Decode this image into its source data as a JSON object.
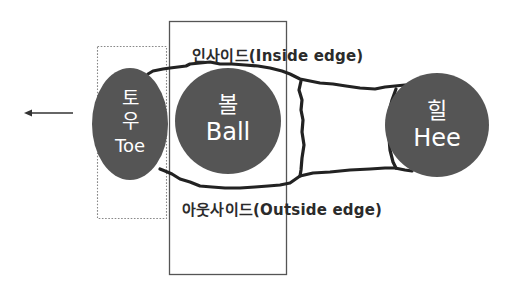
{
  "diagram": {
    "type": "foot-zones",
    "colors": {
      "zone_fill": "#555555",
      "zone_text": "#ffffff",
      "outline": "#222222",
      "box_stroke": "#555555",
      "dotted_stroke": "#888888",
      "label_text": "#2b2b2b",
      "background": "#ffffff"
    },
    "direction_arrow": {
      "icon": "arrow-left-icon",
      "meaning": "forward direction"
    },
    "zones": {
      "toe": {
        "korean_line1": "토",
        "korean_line2": "우",
        "english": "Toe"
      },
      "ball": {
        "korean": "볼",
        "english": "Ball"
      },
      "heel": {
        "korean": "힐",
        "english": "Hee"
      }
    },
    "edges": {
      "inside": "인사이드(Inside edge)",
      "outside": "아웃사이드(Outside edge)"
    },
    "regions": {
      "toe_region": "dotted box around toe",
      "ball_region": "solid box around ball"
    }
  }
}
